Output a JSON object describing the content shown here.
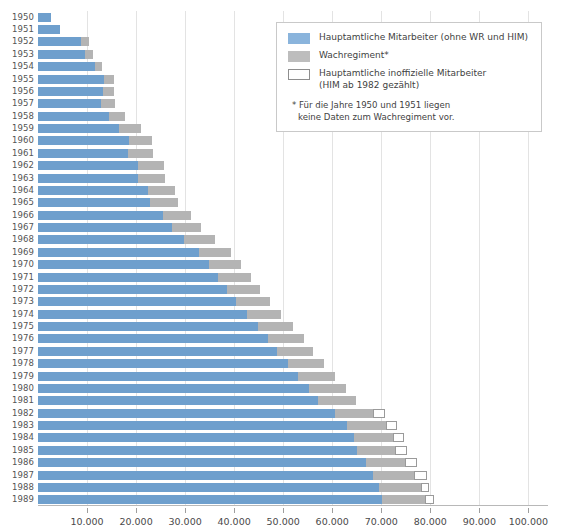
{
  "chart_data": {
    "type": "bar",
    "orientation": "horizontal",
    "stacked": true,
    "title": "",
    "xlabel": "",
    "ylabel": "",
    "xlim": [
      0,
      104000
    ],
    "grid": true,
    "gridlines_x": [
      10000,
      20000,
      30000,
      40000,
      50000,
      60000,
      70000,
      80000,
      90000,
      100000
    ],
    "xticks": [
      10000,
      20000,
      30000,
      40000,
      50000,
      60000,
      70000,
      80000,
      90000,
      100000
    ],
    "xticklabels": [
      "10.000",
      "20.000",
      "30.000",
      "40.000",
      "50.000",
      "60.000",
      "70.000",
      "80.000",
      "90.000",
      "100.000"
    ],
    "categories": [
      "1950",
      "1951",
      "1952",
      "1953",
      "1954",
      "1955",
      "1956",
      "1957",
      "1958",
      "1959",
      "1960",
      "1961",
      "1962",
      "1963",
      "1964",
      "1965",
      "1966",
      "1967",
      "1968",
      "1969",
      "1970",
      "1971",
      "1972",
      "1973",
      "1974",
      "1975",
      "1976",
      "1977",
      "1978",
      "1979",
      "1980",
      "1981",
      "1982",
      "1983",
      "1984",
      "1985",
      "1986",
      "1987",
      "1988",
      "1989"
    ],
    "series": [
      {
        "name": "Hauptamtliche Mitarbeiter (ohne WR und HIM)",
        "color": "#6e9fcd",
        "values": [
          2700,
          4500,
          8800,
          9500,
          11600,
          13500,
          13300,
          12800,
          14400,
          16600,
          18600,
          18400,
          20400,
          20300,
          22400,
          22800,
          25400,
          27400,
          29800,
          32800,
          34800,
          36800,
          38500,
          40400,
          42700,
          44900,
          47000,
          48800,
          50900,
          53100,
          55200,
          57000,
          60500,
          63000,
          64500,
          65000,
          66800,
          68300,
          69500,
          70200
        ]
      },
      {
        "name": "Wachregiment*",
        "color": "#b4b4b4",
        "values": [
          0,
          0,
          1600,
          1700,
          1500,
          2100,
          2200,
          2900,
          3400,
          4500,
          4700,
          5000,
          5200,
          5500,
          5500,
          5700,
          5800,
          5900,
          6200,
          6600,
          6700,
          6700,
          6800,
          6900,
          6900,
          7100,
          7200,
          7300,
          7400,
          7500,
          7600,
          7800,
          7900,
          7900,
          7900,
          7900,
          8000,
          8400,
          8600,
          8800
        ]
      },
      {
        "name": "Hauptamtliche inoffizielle Mitarbeiter (HIM ab 1982 gezählt)",
        "color": "#ffffff",
        "values": [
          0,
          0,
          0,
          0,
          0,
          0,
          0,
          0,
          0,
          0,
          0,
          0,
          0,
          0,
          0,
          0,
          0,
          0,
          0,
          0,
          0,
          0,
          0,
          0,
          0,
          0,
          0,
          0,
          0,
          0,
          0,
          0,
          2400,
          2400,
          2300,
          2300,
          2400,
          2600,
          1600,
          1700
        ]
      }
    ]
  },
  "legend": {
    "position": "top-right",
    "items": [
      {
        "swatch": "blue",
        "label": "Hauptamtliche Mitarbeiter (ohne WR und HIM)",
        "label2": ""
      },
      {
        "swatch": "gray",
        "label": "Wachregiment*",
        "label2": ""
      },
      {
        "swatch": "white",
        "label": "Hauptamtliche inoffizielle Mitarbeiter",
        "label2": "(HIM ab 1982 gezählt)"
      }
    ],
    "note_line1": "* Für die Jahre 1950 und 1951 liegen",
    "note_line2": "keine Daten zum Wachregiment vor."
  },
  "colors": {
    "blue": "#6e9fcd",
    "gray": "#b4b4b4",
    "white": "#ffffff",
    "grid": "#e3e3e3",
    "axis": "#b8b8b8",
    "text": "#4a4a4a"
  }
}
